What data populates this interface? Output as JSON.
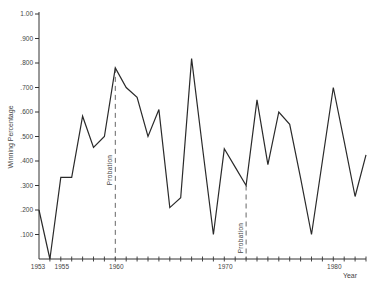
{
  "chart_data": {
    "type": "line",
    "title": "",
    "xlabel": "Year",
    "ylabel": "Winning Percentage",
    "xlim": [
      1953,
      1983
    ],
    "ylim": [
      0,
      1.0
    ],
    "grid": false,
    "legend": null,
    "x_tick_labels": [
      "1953",
      "1955",
      "1960",
      "1970",
      "1980"
    ],
    "y_tick_labels": [
      ".100",
      ".200",
      ".300",
      ".400",
      ".500",
      ".600",
      ".700",
      ".800",
      ".900",
      "1.00"
    ],
    "series": [
      {
        "name": "Winning Percentage",
        "x": [
          1953,
          1954,
          1955,
          1956,
          1957,
          1958,
          1959,
          1960,
          1961,
          1962,
          1963,
          1964,
          1965,
          1966,
          1967,
          1968,
          1969,
          1970,
          1971,
          1972,
          1973,
          1974,
          1975,
          1976,
          1977,
          1978,
          1979,
          1980,
          1981,
          1982,
          1983
        ],
        "values": [
          0.2,
          0.0,
          0.333,
          0.333,
          0.583,
          0.455,
          0.5,
          0.78,
          0.7,
          0.66,
          0.5,
          0.61,
          0.21,
          0.25,
          0.818,
          0.455,
          0.1,
          0.45,
          0.375,
          0.3,
          0.65,
          0.385,
          0.6,
          0.55,
          0.33,
          0.1,
          0.4,
          0.7,
          0.48,
          0.255,
          0.425
        ]
      }
    ],
    "annotations": [
      {
        "type": "vline-dashed",
        "x": 1960,
        "label": "Probation"
      },
      {
        "type": "vline-dashed",
        "x": 1972,
        "label": "Probation"
      }
    ]
  }
}
